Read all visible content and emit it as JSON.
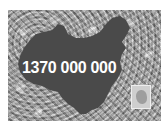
{
  "image": {
    "description": "Grayscale photo of a dense crowd with a dark silhouette map of China overlaid",
    "overlay_text": "1370 000 000",
    "colors": {
      "map_fill": "#4a4a4a",
      "text": "#ffffff",
      "background": "#ffffff"
    }
  }
}
